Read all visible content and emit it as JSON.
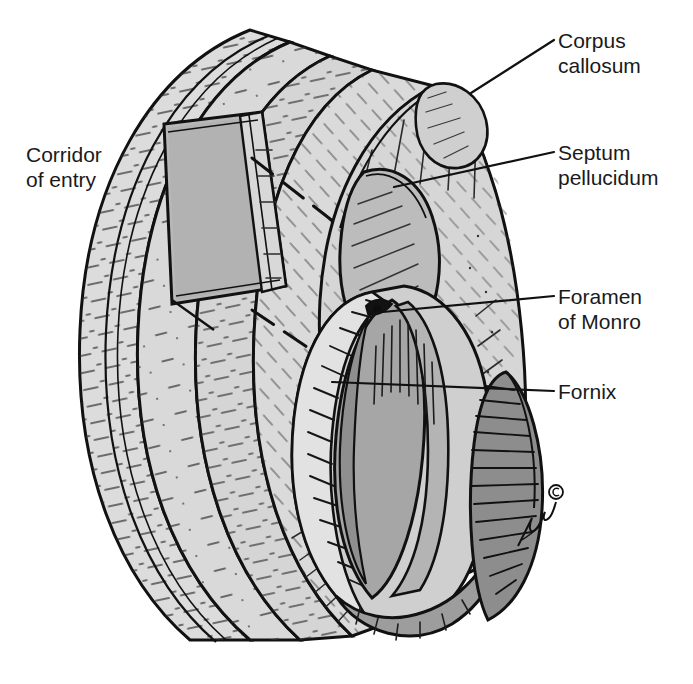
{
  "figure": {
    "kind": "anatomical-line-illustration",
    "background_color": "#ffffff",
    "ink_color": "#1a1a1a",
    "palette": {
      "paper": "#ffffff",
      "cortex_light": "#dcdcdc",
      "cortex_mid": "#c9c9c9",
      "flap_gray": "#b6b6b6",
      "ventricle_gray": "#a8a8a8",
      "deep_gray": "#8f8f8f",
      "shadow_gray": "#6e6e6e",
      "outline": "#111111"
    }
  },
  "labels": [
    {
      "id": "corpus-callosum",
      "text": "Corpus\ncallosum",
      "text_x": 558,
      "text_y": 28,
      "leader": {
        "x1": 554,
        "y1": 40,
        "x2": 471,
        "y2": 93
      }
    },
    {
      "id": "septum-pellucidum",
      "text": "Septum\npellucidum",
      "text_x": 558,
      "text_y": 140,
      "leader": {
        "x1": 554,
        "y1": 152,
        "x2": 394,
        "y2": 187
      }
    },
    {
      "id": "foramen-of-monro",
      "text": "Foramen\nof Monro",
      "text_x": 558,
      "text_y": 284,
      "leader": {
        "x1": 554,
        "y1": 296,
        "x2": 372,
        "y2": 313
      }
    },
    {
      "id": "fornix",
      "text": "Fornix",
      "text_x": 558,
      "text_y": 379,
      "leader": {
        "x1": 554,
        "y1": 391,
        "x2": 332,
        "y2": 382
      }
    },
    {
      "id": "corridor-of-entry",
      "text": "Corridor\nof entry",
      "text_x": 26,
      "text_y": 142,
      "leader": null
    }
  ],
  "annotations": {
    "signature": "artist signature",
    "copyright_mark": "©"
  },
  "structures": [
    {
      "name": "scalp-and-skull-outer-band",
      "tone": "#dcdcdc"
    },
    {
      "name": "cortical-band-outer",
      "tone": "#dcdcdc"
    },
    {
      "name": "cortical-band-middle",
      "tone": "#d4d4d4"
    },
    {
      "name": "white-matter-band",
      "tone": "#d8d8d8"
    },
    {
      "name": "corridor-flap",
      "tone": "#b6b6b6"
    },
    {
      "name": "corpus-callosum-body",
      "tone": "#d2d2d2"
    },
    {
      "name": "septum-pellucidum-plate",
      "tone": "#bdbdbd"
    },
    {
      "name": "lateral-ventricle-cavity",
      "tone": "#a8a8a8"
    },
    {
      "name": "choroid-plexus",
      "tone": "#8f8f8f"
    },
    {
      "name": "fornix-column",
      "tone": "#9a9a9a"
    },
    {
      "name": "hippocampus-thalamus-mass",
      "tone": "#8a8a8a"
    }
  ]
}
